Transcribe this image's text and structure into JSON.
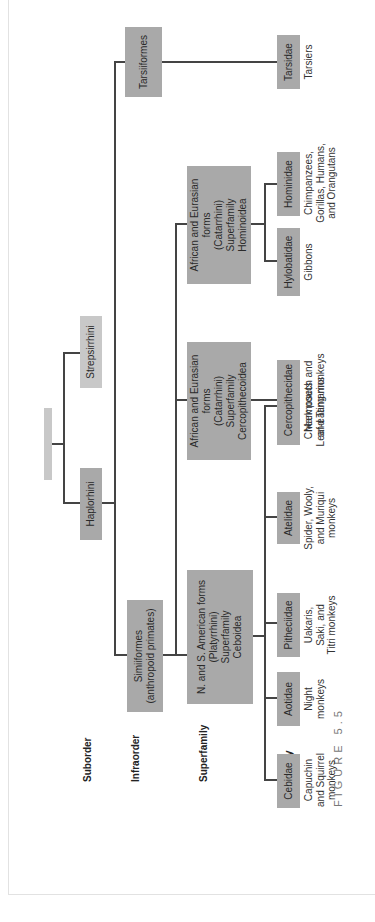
{
  "figure": {
    "caption": "FIGURE 5.5",
    "orientation": "rotated 90 degrees counter-clockwise",
    "colors": {
      "box": "#a9a9a9",
      "box_light": "#c8c8c8",
      "line": "#444444",
      "text": "#2a2a2a"
    }
  },
  "row_labels": {
    "suborder": "Suborder",
    "infraorder": "Infraorder",
    "superfamily": "Superfamily",
    "family": "Family"
  },
  "suborders": {
    "haplorhini": "Haplorhini",
    "strepsirrhini": "Strepsirrhini"
  },
  "infraorders": {
    "simiiformes": "Simiiformes\n(anthropoid primates)",
    "tarsiiformes": "Tarsiiformes"
  },
  "superfamilies": {
    "ceboidea": "N. and S. American forms\n(Platyrrhini)\nSuperfamily\nCeboidea",
    "cercopithecoidea": "African and Eurasian forms\n(Catarrhini)\nSuperfamily\nCercopithecoidea",
    "hominoidea": "African and Eurasian forms\n(Catarrhini)\nSuperfamily\nHominoidea"
  },
  "families": [
    {
      "name": "Cebidae",
      "description": "Capuchin\nand Squirrel\nmonkeys"
    },
    {
      "name": "Aotidae",
      "description": "Night\nmonkeys"
    },
    {
      "name": "Pitheciidae",
      "description": "Uakaris,\nSaki, and\nTitri monkeys"
    },
    {
      "name": "Atelidae",
      "description": "Spider, Wooly,\nand Muriqui\nmonkeys"
    },
    {
      "name": "Callitrichidae",
      "description": "Marmosets\nand Tamarins"
    },
    {
      "name": "Cercopithecidae",
      "description": "Cheek pouch and\nLeaf-eating monkeys"
    },
    {
      "name": "Hylobatidae",
      "description": "Gibbons"
    },
    {
      "name": "Hominidae",
      "description": "Chimpanzees,\nGorillas, Humans,\nand Orangutans"
    },
    {
      "name": "Tarsidae",
      "description": "Tarsiers"
    }
  ]
}
